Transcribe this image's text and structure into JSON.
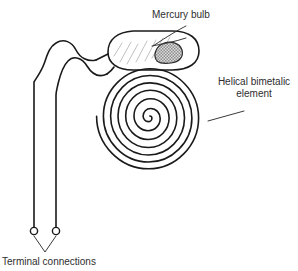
{
  "diagram": {
    "background_color": "#ffffff",
    "ink_color": "#1a1a1a",
    "mercury_fill_color": "#b0b0b0",
    "hatch_color": "#b9b9b9"
  },
  "labels": {
    "mercury_bulb": "Mercury bulb",
    "helical_element_line1": "Helical bimetalic",
    "helical_element_line2": "element",
    "terminal_connections": "Terminal connections"
  },
  "parts": {
    "bulb": {
      "name": "mercury-bulb",
      "shape": "rounded-capsule",
      "hatched": true
    },
    "mercury": {
      "name": "mercury-blob",
      "pattern": "checkered-gray"
    },
    "spiral": {
      "name": "helical-bimetalic-spiral",
      "turns": 4
    },
    "leads": {
      "name": "lead-wires",
      "count": 2
    },
    "terminals": {
      "name": "terminal-circles",
      "count": 2
    }
  }
}
